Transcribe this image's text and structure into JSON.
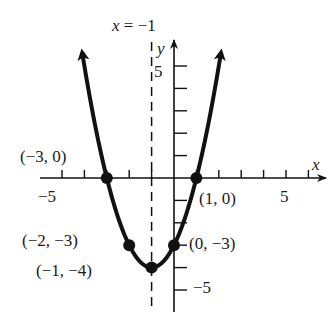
{
  "chart_data": {
    "type": "line",
    "title": "",
    "function": "y = (x + 1)^2 - 4",
    "xlabel": "x",
    "ylabel": "y",
    "xlim": [
      -6,
      7
    ],
    "ylim": [
      -6,
      6
    ],
    "x_tick_labels": [
      "-5",
      "5"
    ],
    "y_tick_labels": [
      "5",
      "-5"
    ],
    "grid": false,
    "axis_of_symmetry": {
      "x": -1,
      "label": "x = −1",
      "style": "dashed"
    },
    "labeled_points": [
      {
        "x": -3,
        "y": 0,
        "label": "(−3, 0)"
      },
      {
        "x": 1,
        "y": 0,
        "label": "(1, 0)"
      },
      {
        "x": -2,
        "y": -3,
        "label": "(−2, −3)"
      },
      {
        "x": 0,
        "y": -3,
        "label": "(0, −3)"
      },
      {
        "x": -1,
        "y": -4,
        "label": "(−1, −4)"
      }
    ],
    "x": [
      -4.1,
      -3,
      -2,
      -1,
      0,
      1,
      2.1
    ],
    "series": [
      {
        "name": "parabola",
        "values": [
          5.6,
          0,
          -3,
          -4,
          -3,
          0,
          5.6
        ]
      }
    ]
  },
  "labels": {
    "symmetry": "x = −1",
    "x_axis": "x",
    "y_axis": "y",
    "x_neg5": "−5",
    "x_pos5": "5",
    "y_pos5": "5",
    "y_neg5": "−5",
    "pt_m3_0": "(−3, 0)",
    "pt_1_0": "(1, 0)",
    "pt_m2_m3": "(−2, −3)",
    "pt_0_m3": "(0, −3)",
    "pt_m1_m4": "(−1, −4)"
  },
  "colors": {
    "ink": "#111111",
    "background": "#ffffff"
  }
}
